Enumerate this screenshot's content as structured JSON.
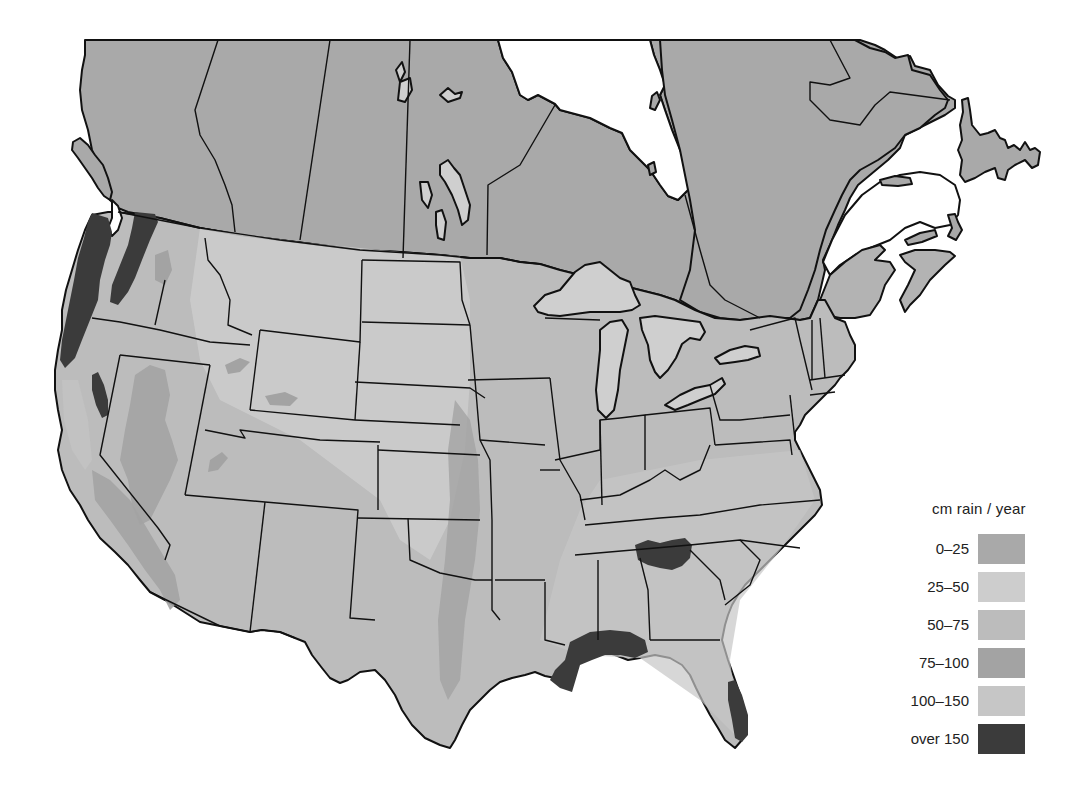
{
  "map": {
    "subject": "Annual precipitation, North America (Canada and contiguous United States)",
    "colors": {
      "band_0_25": "#a9a9a9",
      "band_25_50": "#cdcdcd",
      "band_50_75": "#bcbcbc",
      "band_75_100": "#a3a3a3",
      "band_100_150": "#c6c6c6",
      "band_over_150": "#3b3b3b",
      "border": "#111111",
      "water": "#ffffff",
      "lakes": "#cfcfcf"
    }
  },
  "legend": {
    "title": "cm rain / year",
    "items": [
      {
        "label": "0–25",
        "color": "#a9a9a9"
      },
      {
        "label": "25–50",
        "color": "#cdcdcd"
      },
      {
        "label": "50–75",
        "color": "#bcbcbc"
      },
      {
        "label": "75–100",
        "color": "#a3a3a3"
      },
      {
        "label": "100–150",
        "color": "#c6c6c6"
      },
      {
        "label": "over 150",
        "color": "#3b3b3b"
      }
    ]
  },
  "highlighted_regions": [
    {
      "name": "Pacific Northwest coast",
      "band": "over 150"
    },
    {
      "name": "Cascade range",
      "band": "over 150"
    },
    {
      "name": "Sierra Nevada (north)",
      "band": "over 150"
    },
    {
      "name": "Southern Appalachians",
      "band": "over 150"
    },
    {
      "name": "Gulf coast (Louisiana–Alabama)",
      "band": "over 150"
    },
    {
      "name": "Southeast Florida",
      "band": "over 150"
    }
  ]
}
